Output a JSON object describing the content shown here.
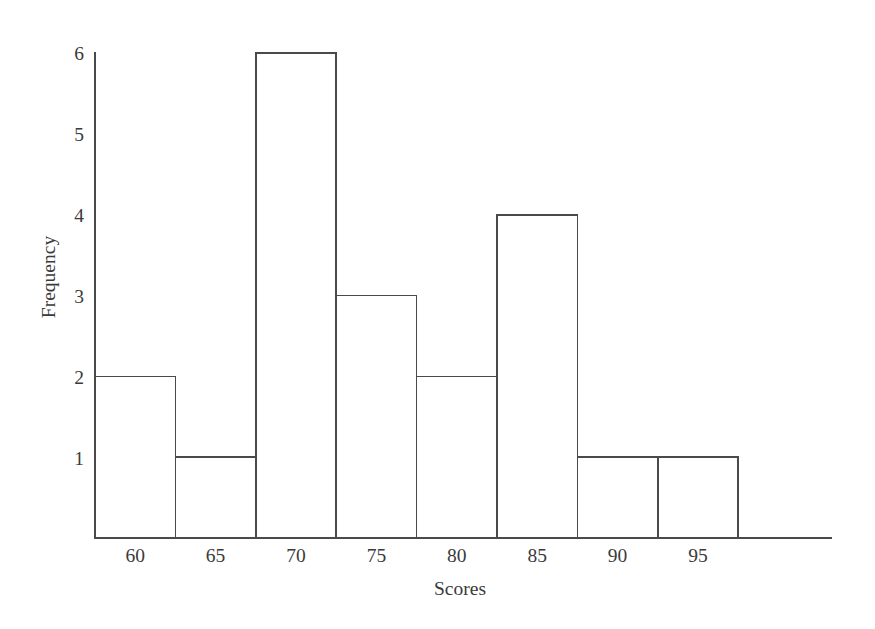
{
  "chart_data": {
    "type": "bar",
    "title": "",
    "subtitle": "",
    "xlabel": "Scores",
    "ylabel": "Frequency",
    "categories": [
      "60",
      "65",
      "70",
      "75",
      "80",
      "85",
      "90",
      "95"
    ],
    "values": [
      2,
      1,
      6,
      3,
      2,
      4,
      1,
      1
    ],
    "series": [
      {
        "name": "Frequency",
        "values": [
          2,
          1,
          6,
          3,
          2,
          4,
          1,
          1
        ]
      }
    ],
    "xtick_labels": [
      "60",
      "65",
      "70",
      "75",
      "80",
      "85",
      "90",
      "95"
    ],
    "ytick_labels": [
      "1",
      "2",
      "3",
      "4",
      "5",
      "6"
    ],
    "ytick_values": [
      1,
      2,
      3,
      4,
      5,
      6
    ],
    "ylim": [
      0,
      6
    ],
    "xlim_note": "bins of width 5, tick labels centered under each bar",
    "grid": false,
    "legend": false,
    "legend_position": "none",
    "bar_style": "outline-only, no fill, adjacent bars sharing edges",
    "colors": {
      "background": "#ffffff",
      "line": "#4a4a4a",
      "bar_fill": "#ffffff",
      "bar_stroke": "#4a4a4a",
      "text": "#3a3a3a"
    }
  },
  "axis": {
    "y_label": "Frequency",
    "x_label": "Scores",
    "y_ticks": [
      "6",
      "5",
      "4",
      "3",
      "2",
      "1"
    ],
    "x_ticks": [
      "60",
      "65",
      "70",
      "75",
      "80",
      "85",
      "90",
      "95"
    ]
  },
  "bars": [
    {
      "label": "60",
      "value": "2"
    },
    {
      "label": "65",
      "value": "1"
    },
    {
      "label": "70",
      "value": "6"
    },
    {
      "label": "75",
      "value": "3"
    },
    {
      "label": "80",
      "value": "2"
    },
    {
      "label": "85",
      "value": "4"
    },
    {
      "label": "90",
      "value": "1"
    },
    {
      "label": "95",
      "value": "1"
    }
  ]
}
